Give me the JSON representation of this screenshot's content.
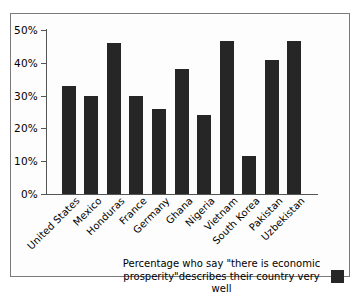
{
  "chart_data": {
    "type": "bar",
    "title": "",
    "subtitle": "",
    "xlabel": "",
    "ylabel": "",
    "categories": [
      "United States",
      "Mexico",
      "Honduras",
      "France",
      "Germany",
      "Ghana",
      "Nigeria",
      "Vietnam",
      "South Korea",
      "Pakistan",
      "Uzbekistan"
    ],
    "values": [
      33,
      30,
      46,
      30,
      26,
      38,
      24,
      46.5,
      11.5,
      41,
      46.5
    ],
    "ylim": [
      0,
      50
    ],
    "yticks": [
      0,
      10,
      20,
      30,
      40,
      50
    ],
    "ytick_labels": [
      "0%",
      "10%",
      "20%",
      "30%",
      "40%",
      "50%"
    ],
    "grid": false,
    "legend_position": "bottom",
    "legend": [
      {
        "label": "Percentage who say \"there is economic prosperity\"describes their country very well",
        "color": "#262626"
      }
    ],
    "series_color": "#262626"
  },
  "legend": {
    "line1": "Percentage who say \"there is economic",
    "line2": "prosperity\"describes their country very well"
  }
}
